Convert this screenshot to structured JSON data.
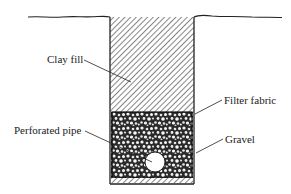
{
  "diagram": {
    "type": "cross-section",
    "labels": {
      "clay_fill": "Clay fill",
      "filter_fabric": "Filter fabric",
      "perforated_pipe": "Perforated pipe",
      "gravel": "Gravel"
    },
    "colors": {
      "line": "#222222",
      "background": "#ffffff"
    }
  }
}
